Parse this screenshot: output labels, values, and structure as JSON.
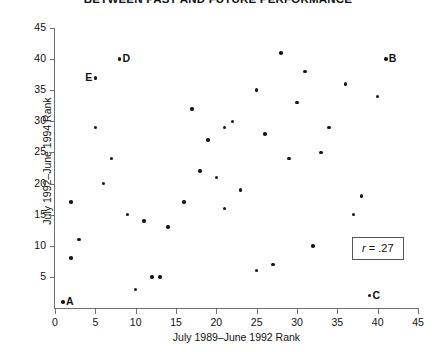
{
  "chart_data": {
    "type": "scatter",
    "title": "BETWEEN PAST AND FUTURE PERFORMANCE",
    "xlabel": "July 1989–June 1992 Rank",
    "ylabel": "July 1992–June 1994 Rank",
    "xlim": [
      0,
      45
    ],
    "ylim": [
      0,
      45
    ],
    "xticks": [
      0,
      5,
      10,
      15,
      20,
      25,
      30,
      35,
      40,
      45
    ],
    "yticks": [
      5,
      10,
      15,
      20,
      25,
      30,
      35,
      40,
      45
    ],
    "xtick_labels": [
      "0",
      "5",
      "10",
      "15",
      "20",
      "25",
      "30",
      "35",
      "40",
      "45"
    ],
    "ytick_labels": [
      "5",
      "10",
      "15",
      "20",
      "25",
      "30",
      "35",
      "40",
      "45"
    ],
    "grid": false,
    "legend": null,
    "annotations": [
      {
        "name": "correlation-box",
        "symbol": "r",
        "operator": "=",
        "value": ".27",
        "text": "r = .27"
      }
    ],
    "points": [
      {
        "x": 1,
        "y": 1,
        "label": "A",
        "label_side": "right"
      },
      {
        "x": 41,
        "y": 40,
        "label": "B",
        "label_side": "right"
      },
      {
        "x": 39,
        "y": 2,
        "label": "C",
        "label_side": "right"
      },
      {
        "x": 8,
        "y": 40,
        "label": "D",
        "label_side": "right"
      },
      {
        "x": 5,
        "y": 37,
        "label": "E",
        "label_side": "left"
      },
      {
        "x": 2,
        "y": 8,
        "label": null,
        "label_side": null
      },
      {
        "x": 2,
        "y": 17,
        "label": null,
        "label_side": null
      },
      {
        "x": 3,
        "y": 11,
        "label": null,
        "label_side": null
      },
      {
        "x": 5,
        "y": 29,
        "label": null,
        "label_side": null
      },
      {
        "x": 6,
        "y": 20,
        "label": null,
        "label_side": null
      },
      {
        "x": 7,
        "y": 24,
        "label": null,
        "label_side": null
      },
      {
        "x": 9,
        "y": 15,
        "label": null,
        "label_side": null
      },
      {
        "x": 10,
        "y": 3,
        "label": null,
        "label_side": null
      },
      {
        "x": 11,
        "y": 14,
        "label": null,
        "label_side": null
      },
      {
        "x": 12,
        "y": 5,
        "label": null,
        "label_side": null
      },
      {
        "x": 13,
        "y": 5,
        "label": null,
        "label_side": null
      },
      {
        "x": 14,
        "y": 13,
        "label": null,
        "label_side": null
      },
      {
        "x": 16,
        "y": 17,
        "label": null,
        "label_side": null
      },
      {
        "x": 17,
        "y": 32,
        "label": null,
        "label_side": null
      },
      {
        "x": 18,
        "y": 22,
        "label": null,
        "label_side": null
      },
      {
        "x": 19,
        "y": 27,
        "label": null,
        "label_side": null
      },
      {
        "x": 20,
        "y": 21,
        "label": null,
        "label_side": null
      },
      {
        "x": 21,
        "y": 29,
        "label": null,
        "label_side": null
      },
      {
        "x": 21,
        "y": 16,
        "label": null,
        "label_side": null
      },
      {
        "x": 22,
        "y": 30,
        "label": null,
        "label_side": null
      },
      {
        "x": 23,
        "y": 19,
        "label": null,
        "label_side": null
      },
      {
        "x": 25,
        "y": 6,
        "label": null,
        "label_side": null
      },
      {
        "x": 25,
        "y": 35,
        "label": null,
        "label_side": null
      },
      {
        "x": 26,
        "y": 28,
        "label": null,
        "label_side": null
      },
      {
        "x": 27,
        "y": 7,
        "label": null,
        "label_side": null
      },
      {
        "x": 28,
        "y": 41,
        "label": null,
        "label_side": null
      },
      {
        "x": 29,
        "y": 24,
        "label": null,
        "label_side": null
      },
      {
        "x": 30,
        "y": 33,
        "label": null,
        "label_side": null
      },
      {
        "x": 31,
        "y": 38,
        "label": null,
        "label_side": null
      },
      {
        "x": 32,
        "y": 10,
        "label": null,
        "label_side": null
      },
      {
        "x": 33,
        "y": 25,
        "label": null,
        "label_side": null
      },
      {
        "x": 34,
        "y": 29,
        "label": null,
        "label_side": null
      },
      {
        "x": 36,
        "y": 36,
        "label": null,
        "label_side": null
      },
      {
        "x": 37,
        "y": 15,
        "label": null,
        "label_side": null
      },
      {
        "x": 38,
        "y": 18,
        "label": null,
        "label_side": null
      },
      {
        "x": 40,
        "y": 34,
        "label": null,
        "label_side": null
      }
    ]
  }
}
